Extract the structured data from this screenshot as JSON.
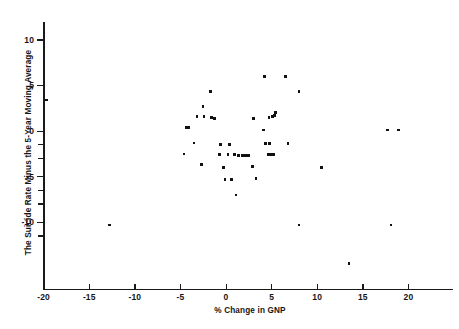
{
  "chart_data": {
    "type": "scatter",
    "title": "",
    "xlabel": "% Change in GNP",
    "ylabel": "The Suicide Rate Minus the 5-Year Moving Average",
    "xlim": [
      -20,
      24
    ],
    "ylim": [
      -13.5,
      13.5
    ],
    "grid": false,
    "legend": null,
    "xticks": [
      -20,
      -15,
      -10,
      -5,
      0,
      5,
      10,
      15,
      20
    ],
    "xtick_labels": [
      "-20",
      "-15",
      "-10",
      "-5",
      "0",
      "5",
      "10",
      "15",
      "20"
    ],
    "yticks": [
      10,
      5,
      0,
      -5,
      -10
    ],
    "ytick_labels": [
      "10",
      "5",
      "0",
      "-5",
      "-10"
    ],
    "y_minor_ticks": [
      -1.5,
      -3,
      -6.5,
      -8,
      -11.5
    ],
    "points": [
      {
        "x": -19.7,
        "y": 3.4
      },
      {
        "x": -12.8,
        "y": -10.3
      },
      {
        "x": -4.3,
        "y": 0.4
      },
      {
        "x": -4.1,
        "y": 0.4
      },
      {
        "x": -3.5,
        "y": -1.3
      },
      {
        "x": -4.6,
        "y": -2.5
      },
      {
        "x": -3.2,
        "y": 1.6
      },
      {
        "x": -2.5,
        "y": 2.7
      },
      {
        "x": -2.4,
        "y": 1.6
      },
      {
        "x": -1.6,
        "y": 1.5
      },
      {
        "x": -1.3,
        "y": 1.4
      },
      {
        "x": -1.2,
        "y": 1.4
      },
      {
        "x": -2.7,
        "y": -3.7
      },
      {
        "x": -1.7,
        "y": 4.3
      },
      {
        "x": -0.6,
        "y": -1.5
      },
      {
        "x": 0.4,
        "y": -1.5
      },
      {
        "x": -0.7,
        "y": -2.6
      },
      {
        "x": 0.2,
        "y": -2.6
      },
      {
        "x": 0.9,
        "y": -2.6
      },
      {
        "x": -0.3,
        "y": -4.0
      },
      {
        "x": -0.1,
        "y": -5.3
      },
      {
        "x": 0.6,
        "y": -5.3
      },
      {
        "x": 1.1,
        "y": -7.0
      },
      {
        "x": 1.4,
        "y": -2.7
      },
      {
        "x": 1.8,
        "y": -2.7
      },
      {
        "x": 2.1,
        "y": -2.7
      },
      {
        "x": 2.3,
        "y": -2.7
      },
      {
        "x": 2.5,
        "y": -2.7
      },
      {
        "x": 4.2,
        "y": 6.0
      },
      {
        "x": 6.5,
        "y": 6.0
      },
      {
        "x": 8.0,
        "y": 4.3
      },
      {
        "x": 3.0,
        "y": 1.4
      },
      {
        "x": 4.7,
        "y": 1.5
      },
      {
        "x": 5.1,
        "y": 1.6
      },
      {
        "x": 5.3,
        "y": 1.7
      },
      {
        "x": 5.4,
        "y": 2.0
      },
      {
        "x": 4.1,
        "y": 0.1
      },
      {
        "x": 4.3,
        "y": -1.4
      },
      {
        "x": 4.8,
        "y": -1.4
      },
      {
        "x": 6.8,
        "y": -1.4
      },
      {
        "x": 4.6,
        "y": -2.6
      },
      {
        "x": 4.9,
        "y": -2.6
      },
      {
        "x": 5.2,
        "y": -2.6
      },
      {
        "x": 2.9,
        "y": -3.9
      },
      {
        "x": 3.3,
        "y": -5.2
      },
      {
        "x": 8.0,
        "y": -10.3
      },
      {
        "x": 10.5,
        "y": -4.0
      },
      {
        "x": 13.5,
        "y": -14.5
      },
      {
        "x": 17.7,
        "y": 0.1
      },
      {
        "x": 18.9,
        "y": 0.1
      },
      {
        "x": 18.1,
        "y": -10.3
      }
    ]
  },
  "axes": {
    "y_title": "The Suicide Rate Minus the 5-Year Moving Average",
    "x_title": "% Change in GNP"
  }
}
